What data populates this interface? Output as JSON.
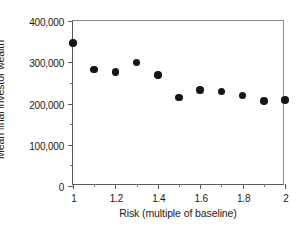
{
  "chart_data": {
    "type": "scatter",
    "title": "",
    "xlabel": "Risk (multiple of baseline)",
    "ylabel": "Mean final investor wealth",
    "xlim": [
      1,
      2
    ],
    "ylim": [
      0,
      400000
    ],
    "grid": false,
    "legend": null,
    "marker": {
      "shape": "circle",
      "color": "#151515",
      "size_px": 7.5
    },
    "x": [
      1,
      1.1,
      1.2,
      1.3,
      1.4,
      1.5,
      1.6,
      1.7,
      1.8,
      1.9,
      2
    ],
    "y": [
      347000,
      282000,
      276000,
      299000,
      269000,
      215000,
      233000,
      229000,
      219000,
      206000,
      208000
    ],
    "xticks": [
      {
        "value": 1,
        "label": "1",
        "minor": false
      },
      {
        "value": 1.1,
        "label": "",
        "minor": true
      },
      {
        "value": 1.2,
        "label": "1.2",
        "minor": false
      },
      {
        "value": 1.3,
        "label": "",
        "minor": true
      },
      {
        "value": 1.4,
        "label": "1.4",
        "minor": false
      },
      {
        "value": 1.5,
        "label": "",
        "minor": true
      },
      {
        "value": 1.6,
        "label": "1.6",
        "minor": false
      },
      {
        "value": 1.7,
        "label": "",
        "minor": true
      },
      {
        "value": 1.8,
        "label": "1.8",
        "minor": false
      },
      {
        "value": 1.9,
        "label": "",
        "minor": true
      },
      {
        "value": 2,
        "label": "2",
        "minor": false
      }
    ],
    "yticks": [
      {
        "value": 0,
        "label": "0",
        "minor": false
      },
      {
        "value": 50000,
        "label": "",
        "minor": true
      },
      {
        "value": 100000,
        "label": "100,000",
        "minor": false
      },
      {
        "value": 150000,
        "label": "",
        "minor": true
      },
      {
        "value": 200000,
        "label": "200,000",
        "minor": false
      },
      {
        "value": 250000,
        "label": "",
        "minor": true
      },
      {
        "value": 300000,
        "label": "300,000",
        "minor": false
      },
      {
        "value": 350000,
        "label": "",
        "minor": true
      },
      {
        "value": 400000,
        "label": "400,000",
        "minor": false
      }
    ]
  }
}
